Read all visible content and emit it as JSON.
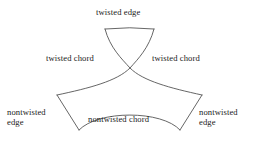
{
  "figure": {
    "background_color": "#ffffff",
    "stroke_color": "#555555",
    "text_color": "#1a1a1a",
    "width": 257,
    "height": 144
  },
  "labels": {
    "twisted_edge": "twisted edge",
    "twisted_chord_left": "twisted chord",
    "twisted_chord_right": "twisted chord",
    "nontwisted_edge_left_line1": "nontwisted",
    "nontwisted_edge_left_line2": "edge",
    "nontwisted_edge_right_line1": "nontwisted",
    "nontwisted_edge_right_line2": "edge",
    "nontwisted_chord": "nontwisted chord"
  },
  "chart_data": {
    "type": "diagram",
    "annotations": [
      {
        "text": "twisted edge",
        "x": 130,
        "y": 12,
        "anchor": "middle"
      },
      {
        "text": "twisted chord",
        "x": 80,
        "y": 59,
        "anchor": "middle"
      },
      {
        "text": "twisted chord",
        "x": 186,
        "y": 59,
        "anchor": "middle"
      },
      {
        "text": "nontwisted chord",
        "x": 130,
        "y": 120,
        "anchor": "middle"
      },
      {
        "text": "nontwisted edge",
        "x": 34,
        "y": 117,
        "anchor": "middle"
      },
      {
        "text": "nontwisted edge",
        "x": 226,
        "y": 117,
        "anchor": "middle"
      }
    ],
    "vertices": {
      "top_left": [
        105,
        29
      ],
      "top_right": [
        154,
        29
      ],
      "center_crossing": [
        130,
        68
      ],
      "left": [
        57,
        95
      ],
      "right": [
        202,
        95
      ],
      "bottom_left": [
        79,
        130
      ],
      "bottom_right": [
        180,
        130
      ]
    },
    "paths": [
      {
        "name": "twisted-edge",
        "d": "M 105 29 Q 130 26.5 154 29",
        "label": "twisted edge"
      },
      {
        "name": "twisted-chord-left-branch",
        "d": "M 105 29 C 110 48 122 59 130 68 C 143 81 170 88 202 95",
        "label": "twisted chord"
      },
      {
        "name": "twisted-chord-right-branch",
        "d": "M 154 29 C 149 48 138 59 130 68 C 117 81 90 88 57 95",
        "label": "twisted chord"
      },
      {
        "name": "nontwisted-edge-left",
        "d": "M 57 95 L 79 130",
        "label": "nontwisted edge"
      },
      {
        "name": "nontwisted-edge-right",
        "d": "M 202 95 L 180 130",
        "label": "nontwisted edge"
      },
      {
        "name": "nontwisted-chord",
        "d": "M 79 130 C 98 110 162 110 180 130",
        "label": "nontwisted chord"
      }
    ]
  }
}
